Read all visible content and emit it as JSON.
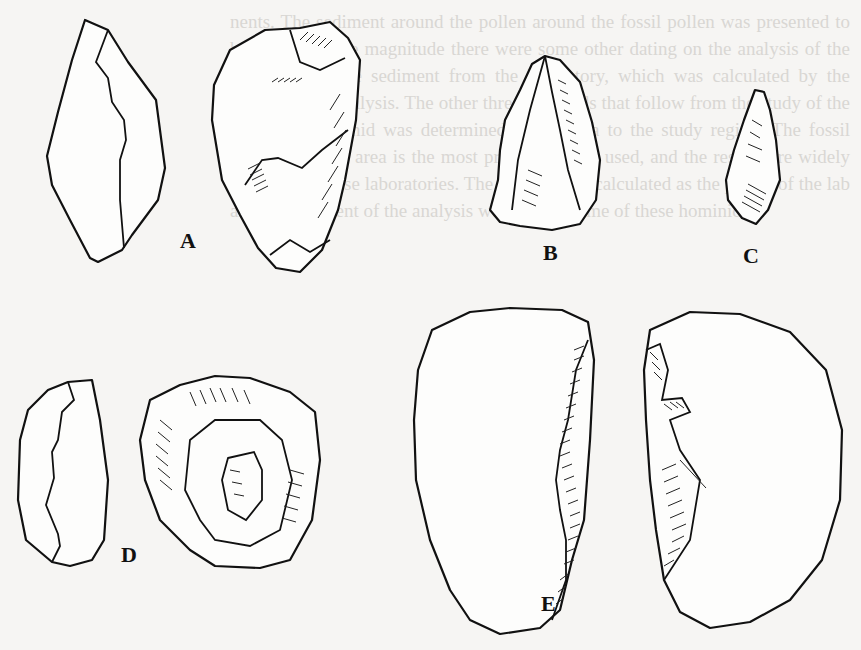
{
  "figure": {
    "type": "archaeological line drawing",
    "labels": [
      {
        "id": "A",
        "text": "A",
        "description": "flake shown in two views: outline and dorsal surface with scar hatching"
      },
      {
        "id": "B",
        "text": "B",
        "description": "triangular point/flake with central ridge"
      },
      {
        "id": "C",
        "text": "C",
        "description": "small retouched point"
      },
      {
        "id": "D",
        "text": "D",
        "description": "ring-shaped core/scraper shown in two views"
      },
      {
        "id": "E",
        "text": "E",
        "description": "large oval biface/tool shown in two views with hatched edge"
      }
    ]
  },
  "background": {
    "ghost_text": "nents. The sediment around the pollen around the fossil pollen was presented to be in the. As the magnitude there were some other dating on the analysis of the hominids, to the sediment from the laboratory, which was calculated by the results of the analysis. The other three hominids that follow from the study of the past on a hominid was determined in the area to the study region. The fossil sediment in the area is the most preferred to be used, and the results are widely accepted in these laboratories. The results were calculated as the period of the lab and the sediment of the analysis were set on some of these hominids."
  },
  "colors": {
    "paper": "#f6f5f3",
    "ink": "#111111",
    "ghost": "#d9d7d3"
  }
}
